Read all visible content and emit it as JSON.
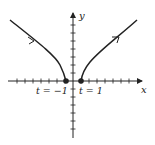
{
  "figure": {
    "axes": {
      "x_label": "x",
      "y_label": "y"
    },
    "points": [
      {
        "label": "t = −1",
        "description": "left endpoint"
      },
      {
        "label": "t = 1",
        "description": "right endpoint"
      }
    ],
    "colors": {
      "ink": "#222222",
      "background": "#ffffff"
    }
  }
}
